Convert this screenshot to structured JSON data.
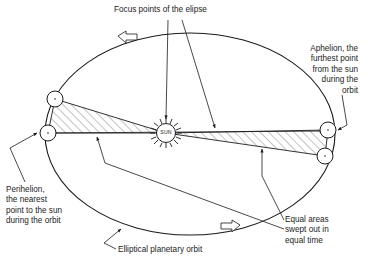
{
  "diagram": {
    "stroke_color": "#1b1b1b",
    "hatch_color": "#6e6e6e",
    "background": "#ffffff",
    "labels": {
      "focus_points": "Focus points of the elipse",
      "aphelion": "Aphelion, the\nfurthest point\nfrom the sun\nduring the\norbit",
      "perihelion": "Perihelion,\nthe nearest\npoint to the sun\nduring the orbit",
      "equal_areas": "Equal areas\nswept out in\nequal time",
      "orbit": "Elliptical planetary orbit",
      "sun": "SUN"
    },
    "icons": {
      "sun": "sun-icon",
      "planet": "planet-circle-icon",
      "direction_arrow": "orbit-direction-arrow-icon",
      "leader_arrow": "leader-arrow-icon"
    },
    "geometry": {
      "ellipse": {
        "cx": 190,
        "cy": 134,
        "rx": 145,
        "ry": 101
      },
      "sun_focus": {
        "x": 166,
        "y": 133,
        "r": 10
      },
      "second_focus": {
        "x": 215,
        "y": 131
      },
      "planets": [
        {
          "name": "planet-upper-left",
          "x": 55,
          "y": 99,
          "r": 8
        },
        {
          "name": "planet-perihelion",
          "x": 48,
          "y": 133,
          "r": 8
        },
        {
          "name": "planet-aphelion",
          "x": 328,
          "y": 130,
          "r": 8
        },
        {
          "name": "planet-lower-right",
          "x": 325,
          "y": 156,
          "r": 8
        }
      ],
      "swept_areas": [
        {
          "name": "left-sector",
          "vertices": "166,133 55,99 48,133"
        },
        {
          "name": "right-sector",
          "vertices": "166,133 328,130 325,156"
        }
      ],
      "direction_arrows": [
        {
          "name": "top-arrow",
          "x": 128,
          "y": 37,
          "points_to": "left"
        },
        {
          "name": "bottom-arrow",
          "x": 229,
          "y": 226,
          "points_to": "right"
        }
      ]
    }
  }
}
